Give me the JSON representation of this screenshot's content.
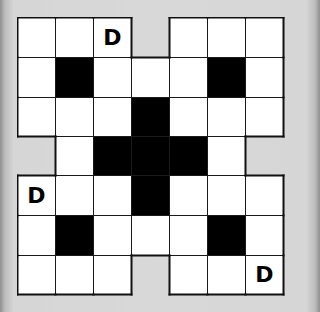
{
  "puzzle": {
    "rows": 7,
    "cols": 7,
    "legend": {
      "empty": ".",
      "block": "#",
      "void": "_"
    },
    "grid": [
      [
        ".",
        ".",
        "D",
        "_",
        ".",
        ".",
        "."
      ],
      [
        ".",
        "#",
        ".",
        ".",
        ".",
        "#",
        "."
      ],
      [
        ".",
        ".",
        ".",
        "#",
        ".",
        ".",
        "."
      ],
      [
        "_",
        ".",
        "#",
        "#",
        "#",
        ".",
        "_"
      ],
      [
        "D",
        ".",
        ".",
        "#",
        ".",
        ".",
        "."
      ],
      [
        ".",
        "#",
        ".",
        ".",
        ".",
        "#",
        "."
      ],
      [
        ".",
        ".",
        ".",
        "_",
        ".",
        ".",
        "D"
      ]
    ],
    "given_letters": [
      {
        "row": 0,
        "col": 2,
        "letter": "D"
      },
      {
        "row": 4,
        "col": 0,
        "letter": "D"
      },
      {
        "row": 6,
        "col": 6,
        "letter": "D"
      }
    ]
  },
  "colors": {
    "cell_fill": "#ffffff",
    "block_fill": "#000000",
    "grid_line": "#1a1a1a",
    "background": "#d8d8d8"
  }
}
